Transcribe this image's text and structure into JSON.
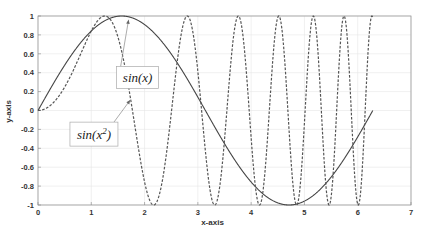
{
  "chart_data": {
    "type": "line",
    "title": "",
    "xlabel": "x-axis",
    "ylabel": "y-axis",
    "xlim": [
      0,
      7
    ],
    "ylim": [
      -1,
      1
    ],
    "xticks": [
      0,
      1,
      2,
      3,
      4,
      5,
      6,
      7
    ],
    "xtick_labels": [
      "0",
      "1",
      "2",
      "3",
      "4",
      "5",
      "6",
      "7"
    ],
    "yticks": [
      1,
      0.8,
      0.6,
      0.4,
      0.2,
      0,
      -0.2,
      -0.4,
      -0.6,
      -0.8,
      -1
    ],
    "ytick_labels": [
      "1",
      "0.8",
      "0.6",
      "0.4",
      "0.2",
      "0",
      "-0.2",
      "-0.4",
      "-0.6",
      "-0.8",
      "-1"
    ],
    "grid": true,
    "legend": null,
    "series": [
      {
        "name": "sin(x)",
        "function": "sin(x)",
        "x_range": [
          0,
          6.2832
        ],
        "style": "solid",
        "color": "#444444",
        "sample_points": [
          [
            0,
            0
          ],
          [
            0.5236,
            0.5
          ],
          [
            1.0472,
            0.866
          ],
          [
            1.5708,
            1
          ],
          [
            2.0944,
            0.866
          ],
          [
            2.618,
            0.5
          ],
          [
            3.1416,
            0
          ],
          [
            3.6652,
            -0.5
          ],
          [
            4.1888,
            -0.866
          ],
          [
            4.7124,
            -1
          ],
          [
            5.236,
            -0.866
          ],
          [
            5.7596,
            -0.5
          ],
          [
            6.2832,
            0
          ]
        ]
      },
      {
        "name": "sin(x^2)",
        "function": "sin(x^2)",
        "x_range": [
          0,
          6.2832
        ],
        "style": "dashed",
        "color": "#555555",
        "sample_points": [
          [
            0,
            0
          ],
          [
            0.5,
            0.247
          ],
          [
            1.0,
            0.841
          ],
          [
            1.2533,
            1
          ],
          [
            1.5,
            0.778
          ],
          [
            1.7725,
            0
          ],
          [
            2.1708,
            -1
          ],
          [
            2.5066,
            0
          ],
          [
            2.8025,
            1
          ],
          [
            3.07,
            0
          ],
          [
            3.316,
            -1
          ],
          [
            3.5449,
            0
          ],
          [
            3.7599,
            1
          ],
          [
            3.9633,
            0
          ],
          [
            4.1568,
            -1
          ],
          [
            4.3416,
            0
          ],
          [
            4.5189,
            1
          ],
          [
            4.6895,
            0
          ],
          [
            4.8541,
            -1
          ],
          [
            5.0133,
            0
          ],
          [
            5.1675,
            1
          ],
          [
            5.3174,
            0
          ],
          [
            5.4631,
            -1
          ],
          [
            5.605,
            0
          ],
          [
            5.7434,
            1
          ],
          [
            5.8786,
            0
          ],
          [
            6.0106,
            -1
          ],
          [
            6.1399,
            0
          ],
          [
            6.2664,
            1
          ]
        ]
      }
    ],
    "annotations": [
      {
        "text": "sin(x)",
        "box_xy": [
          1.87,
          0.35
        ],
        "arrow_to": [
          1.7,
          0.96
        ],
        "target_series": "sin(x)"
      },
      {
        "text": "sin(x^2)",
        "box_xy": [
          1.05,
          -0.25
        ],
        "arrow_to": [
          1.73,
          0.11
        ],
        "target_series": "sin(x^2)"
      }
    ]
  },
  "annotations_display": {
    "sin_x": {
      "base": "sin(x)"
    },
    "sin_x2": {
      "base": "sin(x",
      "sup": "2",
      "close": ")"
    }
  }
}
